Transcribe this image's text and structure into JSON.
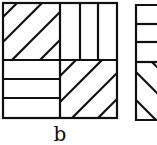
{
  "figure": {
    "caption": "b",
    "stroke_color": "#111111",
    "background": "#ffffff",
    "panels": [
      {
        "name": "square-b",
        "quadrants": {
          "top_left": "diagonal-forward",
          "top_right": "vertical",
          "bottom_left": "horizontal",
          "bottom_right": "diagonal-forward"
        }
      },
      {
        "name": "square-c-partial",
        "quadrants": {
          "top": "horizontal",
          "bottom": "diagonal-backward"
        }
      }
    ]
  }
}
